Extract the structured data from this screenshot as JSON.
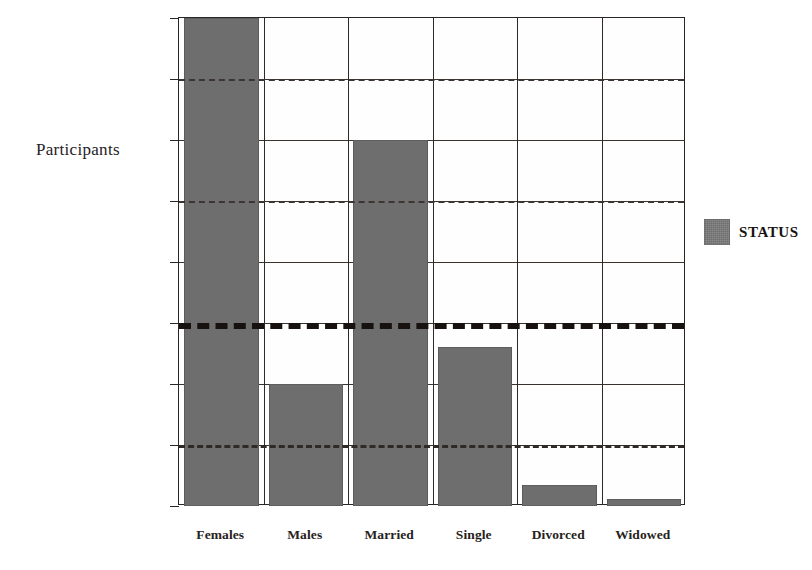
{
  "chart_data": {
    "type": "bar",
    "title": "",
    "xlabel": "",
    "ylabel": "Participants",
    "categories": [
      "Females",
      "Males",
      "Married",
      "Single",
      "Divorced",
      "Widowed"
    ],
    "series": [
      {
        "name": "STATUS",
        "color": "#6e6e6e",
        "values": [
          8.0,
          2.0,
          6.0,
          2.6,
          0.34,
          0.12
        ]
      }
    ],
    "ylim": [
      0,
      8
    ],
    "y_tick_values": [
      0,
      1,
      2,
      3,
      4,
      5,
      6,
      7,
      8
    ],
    "y_tick_labels_visible": false,
    "grid": true,
    "legend": {
      "position": "right",
      "entries": [
        {
          "label": "STATUS",
          "color": "#6e6e6e"
        }
      ]
    },
    "reference_lines": [
      {
        "value": 7.0,
        "style": "dashed",
        "weight": "thin",
        "color": "#3b3633"
      },
      {
        "value": 5.0,
        "style": "dashed",
        "weight": "thin",
        "color": "#3b3633"
      },
      {
        "value": 3.0,
        "style": "dashed",
        "weight": "thick",
        "color": "#17120f"
      },
      {
        "value": 1.0,
        "style": "dashed",
        "weight": "medium",
        "color": "#2e2a27"
      }
    ],
    "annotations": []
  },
  "axis": {
    "y_title": "Participants"
  },
  "legend": {
    "status_label": "STATUS"
  }
}
